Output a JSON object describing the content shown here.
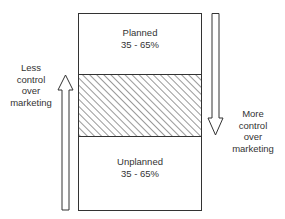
{
  "diagram": {
    "top_section": {
      "label": "Planned",
      "range": "35 - 65%"
    },
    "middle_section": {
      "style": "hatched"
    },
    "bottom_section": {
      "label": "Unplanned",
      "range": "35 - 65%"
    },
    "left_arrow": {
      "direction": "up",
      "label_lines": [
        "Less",
        "control",
        "over",
        "marketing"
      ]
    },
    "right_arrow": {
      "direction": "down",
      "label_lines": [
        "More",
        "control",
        "over",
        "marketing"
      ]
    },
    "colors": {
      "line": "#333333",
      "background": "#ffffff"
    }
  }
}
